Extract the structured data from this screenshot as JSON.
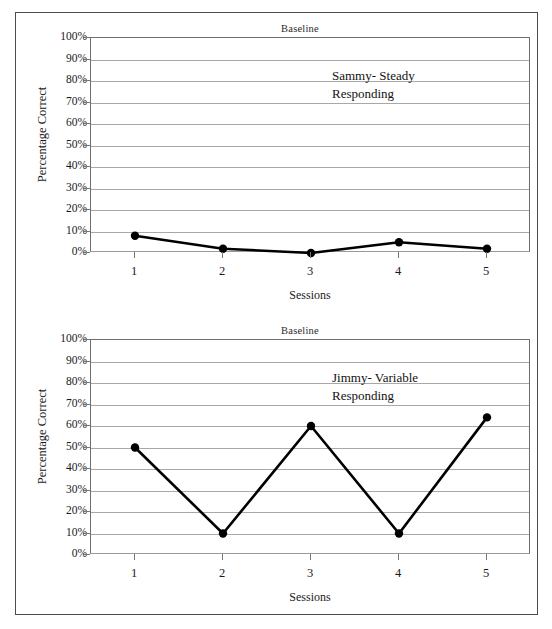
{
  "charts": [
    {
      "id": "sammy",
      "title": "Baseline",
      "xlabel": "Sessions",
      "ylabel": "Percentage Correct",
      "annotation_line1": "Sammy- Steady",
      "annotation_line2": "Responding",
      "yticks": [
        "100%",
        "90%",
        "80%",
        "70%",
        "60%",
        "50%",
        "40%",
        "30%",
        "20%",
        "10%",
        "0%"
      ],
      "xticks": [
        "1",
        "2",
        "3",
        "4",
        "5"
      ]
    },
    {
      "id": "jimmy",
      "title": "Baseline",
      "xlabel": "Sessions",
      "ylabel": "Percentage Correct",
      "annotation_line1": "Jimmy- Variable",
      "annotation_line2": "Responding",
      "yticks": [
        "100%",
        "90%",
        "80%",
        "70%",
        "60%",
        "50%",
        "40%",
        "30%",
        "20%",
        "10%",
        "0%"
      ],
      "xticks": [
        "1",
        "2",
        "3",
        "4",
        "5"
      ]
    }
  ],
  "chart_data": [
    {
      "type": "line",
      "id": "sammy",
      "title": "Baseline",
      "subtitle": "Sammy- Steady Responding",
      "xlabel": "Sessions",
      "ylabel": "Percentage Correct",
      "categories": [
        "1",
        "2",
        "3",
        "4",
        "5"
      ],
      "x": [
        1,
        2,
        3,
        4,
        5
      ],
      "values": [
        8,
        2,
        0,
        5,
        2
      ],
      "series": [
        {
          "name": "Sammy- Steady Responding",
          "values": [
            8,
            2,
            0,
            5,
            2
          ]
        }
      ],
      "ylim": [
        0,
        100
      ],
      "ytick_step": 10,
      "xlim": [
        1,
        5
      ],
      "grid": "horizontal",
      "legend": "none",
      "marker": "filled-circle",
      "line_color": "#000000"
    },
    {
      "type": "line",
      "id": "jimmy",
      "title": "Baseline",
      "subtitle": "Jimmy- Variable Responding",
      "xlabel": "Sessions",
      "ylabel": "Percentage Correct",
      "categories": [
        "1",
        "2",
        "3",
        "4",
        "5"
      ],
      "x": [
        1,
        2,
        3,
        4,
        5
      ],
      "values": [
        50,
        10,
        60,
        10,
        64
      ],
      "series": [
        {
          "name": "Jimmy- Variable Responding",
          "values": [
            50,
            10,
            60,
            10,
            64
          ]
        }
      ],
      "ylim": [
        0,
        100
      ],
      "ytick_step": 10,
      "xlim": [
        1,
        5
      ],
      "grid": "horizontal",
      "legend": "none",
      "marker": "filled-circle",
      "line_color": "#000000"
    }
  ],
  "colors": {
    "line": "#000000",
    "grid": "#a8a8a8",
    "axis": "#6e6e6e",
    "frame": "#4c4c4c",
    "background": "#ffffff"
  }
}
